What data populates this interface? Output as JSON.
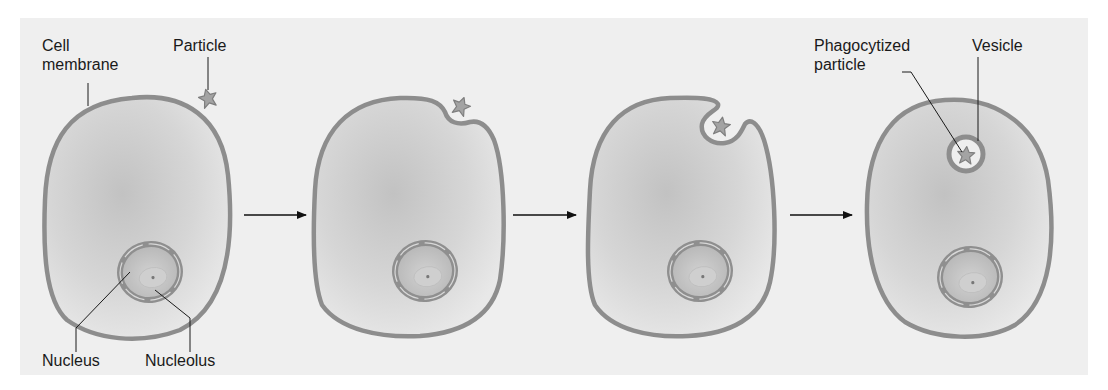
{
  "figure": {
    "stages": [
      {
        "id": 1,
        "description": "Particle near cell membrane"
      },
      {
        "id": 2,
        "description": "Membrane begins to indent around particle"
      },
      {
        "id": 3,
        "description": "Membrane engulfs particle"
      },
      {
        "id": 4,
        "description": "Particle enclosed in vesicle inside cell"
      }
    ],
    "labels": {
      "cell_membrane_line1": "Cell",
      "cell_membrane_line2": "membrane",
      "particle": "Particle",
      "nucleus": "Nucleus",
      "nucleolus": "Nucleolus",
      "phagocytized_line1": "Phagocytized",
      "phagocytized_line2": "particle",
      "vesicle": "Vesicle"
    },
    "arrows": [
      {
        "from": 1,
        "to": 2
      },
      {
        "from": 2,
        "to": 3
      },
      {
        "from": 3,
        "to": 4
      }
    ],
    "colors": {
      "background": "#efefef",
      "membrane": "#8d8d8d",
      "cytoplasm_center": "#c4c4c4",
      "cytoplasm_edge": "#e6e6e6",
      "particle": "#9a9a9a",
      "leader_line": "#1a1a1a"
    }
  }
}
